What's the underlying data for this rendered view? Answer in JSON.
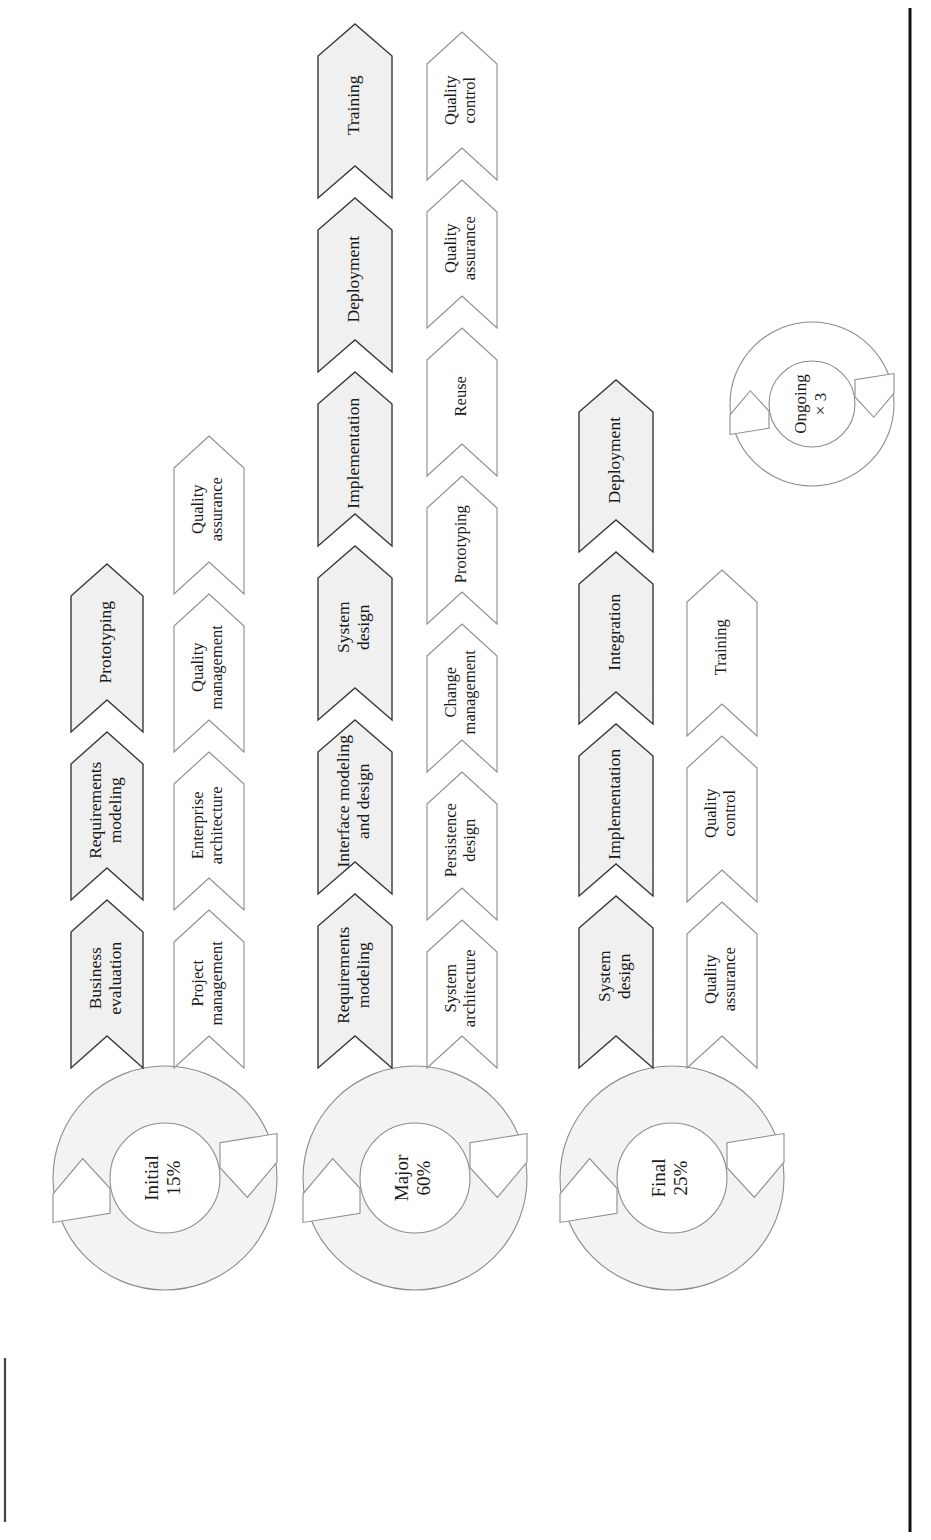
{
  "diagram": {
    "orientation": "rotated-90",
    "colors": {
      "major_fill": "#f0f0f0",
      "major_stroke": "#3a3a3a",
      "minor_fill": "#ffffff",
      "minor_stroke": "#8d8d8d",
      "ring_fill": "#f3f3f3",
      "ring_stroke": "#8d8d8d",
      "text": "#1a1a1a",
      "rule": "#111111"
    },
    "phases": [
      {
        "id": "initial",
        "ring": {
          "name": "Initial",
          "percent": "15%",
          "filled": true
        },
        "primary_track": [
          "Business\nevaluation",
          "Requirements\nmodeling",
          "Prototyping"
        ],
        "support_track": [
          "Project\nmanagement",
          "Enterprise\narchitecture",
          "Quality\nmanagement",
          "Quality\nassurance"
        ]
      },
      {
        "id": "major",
        "ring": {
          "name": "Major",
          "percent": "60%",
          "filled": true
        },
        "primary_track": [
          "Requirements\nmodeling",
          "Interface modeling\nand design",
          "System\ndesign",
          "Implementation",
          "Deployment",
          "Training"
        ],
        "support_track": [
          "System\narchitecture",
          "Persistence\ndesign",
          "Change\nmanagement",
          "Prototyping",
          "Reuse",
          "Quality\nassurance",
          "Quality\ncontrol"
        ]
      },
      {
        "id": "final",
        "ring": {
          "name": "Final",
          "percent": "25%",
          "filled": true
        },
        "primary_track": [
          "System\ndesign",
          "Implementation",
          "Integration",
          "Deployment"
        ],
        "support_track": [
          "Quality\nassurance",
          "Quality\ncontrol",
          "Training"
        ]
      }
    ],
    "ongoing": {
      "name": "Ongoing",
      "percent": "× 3",
      "filled": false
    }
  }
}
